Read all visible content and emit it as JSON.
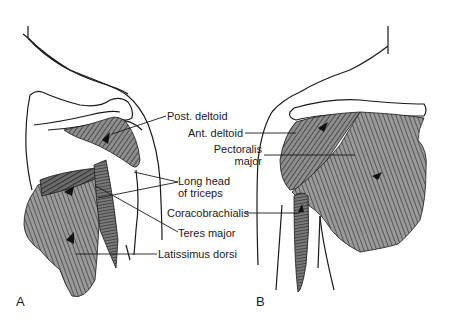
{
  "figure": {
    "panels": [
      {
        "id": "A",
        "letter": "A",
        "view": "posterior shoulder"
      },
      {
        "id": "B",
        "letter": "B",
        "view": "anterior shoulder"
      }
    ],
    "labels": {
      "post_deltoid": "Post. deltoid",
      "ant_deltoid": "Ant. deltoid",
      "pectoralis_line1": "Pectoralis",
      "pectoralis_line2": "major",
      "long_head_line1": "Long head",
      "long_head_line2": "of triceps",
      "coracobrachialis": "Coracobrachialis",
      "teres_major": "Teres major",
      "latissimus_dorsi": "Latissimus dorsi"
    },
    "colors": {
      "outline": "#1a1a1a",
      "muscle_fill": "#9a9a9a",
      "muscle_dark": "#4a4a4a",
      "background": "#ffffff"
    }
  }
}
